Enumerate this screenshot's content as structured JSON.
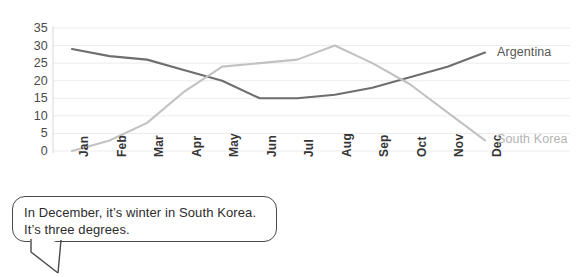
{
  "chart_data": {
    "type": "line",
    "title": "",
    "subtitle": "",
    "xlabel": "",
    "ylabel": "",
    "categories": [
      "Jan",
      "Feb",
      "Mar",
      "Apr",
      "May",
      "Jun",
      "Jul",
      "Aug",
      "Sep",
      "Oct",
      "Nov",
      "Dec"
    ],
    "ylim": [
      0,
      35
    ],
    "ytick_values": [
      0,
      5,
      10,
      15,
      20,
      25,
      30,
      35
    ],
    "ytick_labels": [
      "0",
      "5",
      "10",
      "15",
      "20",
      "25",
      "30",
      "35"
    ],
    "grid": "horizontal",
    "legend_position": "end-of-line",
    "series": [
      {
        "name": "Argentina",
        "color": "#6e6e6e",
        "values": [
          29,
          27,
          26,
          23,
          20,
          15,
          15,
          16,
          18,
          21,
          24,
          28
        ]
      },
      {
        "name": "South Korea",
        "color": "#c2c2c2",
        "values": [
          0,
          3,
          8,
          17,
          24,
          25,
          26,
          30,
          25,
          19,
          11,
          3
        ]
      }
    ],
    "annotations": [
      {
        "name": "speech-bubble",
        "line1": "In December, it’s winter in South Korea.",
        "line2": "It’s three degrees."
      }
    ]
  },
  "colors": {
    "argentina": "#6e6e6e",
    "south_korea": "#c2c2c2",
    "gridline": "#ececec",
    "axis": "#d8d8d8",
    "text": "#3a3a3a",
    "bubble_border": "#4a4a4a"
  }
}
